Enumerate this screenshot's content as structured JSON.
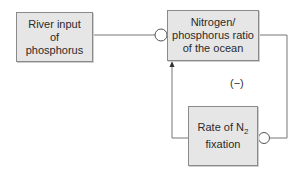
{
  "diagram": {
    "nodes": [
      {
        "id": "river",
        "label": "River input of phosphorus"
      },
      {
        "id": "ratio",
        "label": "Nitrogen/ phosphorus ratio of the ocean"
      },
      {
        "id": "fixation",
        "label_prefix": "Rate of N",
        "label_sub": "2",
        "label_suffix": "fixation"
      }
    ],
    "edges": [
      {
        "from": "river",
        "to": "ratio",
        "effect": "negative",
        "marker": "circle"
      },
      {
        "from": "ratio",
        "to": "fixation",
        "effect": "negative",
        "marker": "circle"
      },
      {
        "from": "fixation",
        "to": "ratio",
        "effect": "positive",
        "marker": "arrow"
      }
    ],
    "loop_sign": "(−)"
  },
  "colors": {
    "box_fill": "#e6e6e6",
    "box_border": "#8a8a8a",
    "line": "#777777"
  }
}
